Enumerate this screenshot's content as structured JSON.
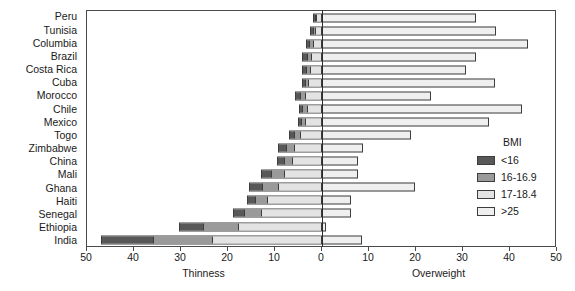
{
  "chart_data": {
    "type": "bar",
    "orientation": "horizontal",
    "stacked": true,
    "diverging": true,
    "title": "",
    "xlabel_left": "Thinness",
    "xlabel_right": "Overweight",
    "ylabel": "",
    "xlim": [
      -50,
      50
    ],
    "xticks": [
      -50,
      -40,
      -30,
      -20,
      -10,
      0,
      10,
      20,
      30,
      40,
      50
    ],
    "xticklabels": [
      "50",
      "40",
      "30",
      "20",
      "10",
      "0",
      "10",
      "20",
      "30",
      "40",
      "50"
    ],
    "grid": false,
    "legend_title": "BMI",
    "legend_position": "right",
    "categories": [
      "Peru",
      "Tunisia",
      "Columbia",
      "Brazil",
      "Costa Rica",
      "Cuba",
      "Morocco",
      "Chile",
      "Mexico",
      "Togo",
      "Zimbabwe",
      "China",
      "Mali",
      "Ghana",
      "Haiti",
      "Senegal",
      "Ethiopia",
      "India"
    ],
    "series": [
      {
        "name": "<16",
        "direction": "left",
        "color": "#585858",
        "values": [
          0.3,
          0.4,
          0.7,
          0.8,
          0.6,
          0.5,
          0.9,
          0.7,
          0.6,
          1.0,
          1.4,
          1.2,
          2.1,
          2.6,
          1.5,
          2.3,
          5.0,
          11.0
        ]
      },
      {
        "name": "16-16.9",
        "direction": "left",
        "color": "#9a9a9a",
        "values": [
          0.4,
          0.5,
          0.8,
          1.0,
          0.9,
          0.8,
          1.2,
          1.0,
          0.9,
          1.3,
          1.9,
          1.8,
          2.8,
          3.5,
          2.6,
          3.7,
          7.5,
          12.5
        ]
      },
      {
        "name": "17-18.4",
        "direction": "left",
        "color": "#e3e3e3",
        "values": [
          1.3,
          1.6,
          2.0,
          2.4,
          2.7,
          3.0,
          3.6,
          3.3,
          3.7,
          4.8,
          6.0,
          6.5,
          8.1,
          9.5,
          11.8,
          13.0,
          18.0,
          23.5
        ]
      },
      {
        "name": ">25",
        "direction": "right",
        "color": "#efefef",
        "values": [
          32.8,
          37.0,
          43.8,
          32.8,
          30.6,
          36.8,
          23.2,
          42.5,
          35.5,
          18.9,
          8.7,
          7.7,
          7.7,
          19.8,
          6.2,
          6.2,
          0.9,
          8.5
        ]
      }
    ]
  }
}
